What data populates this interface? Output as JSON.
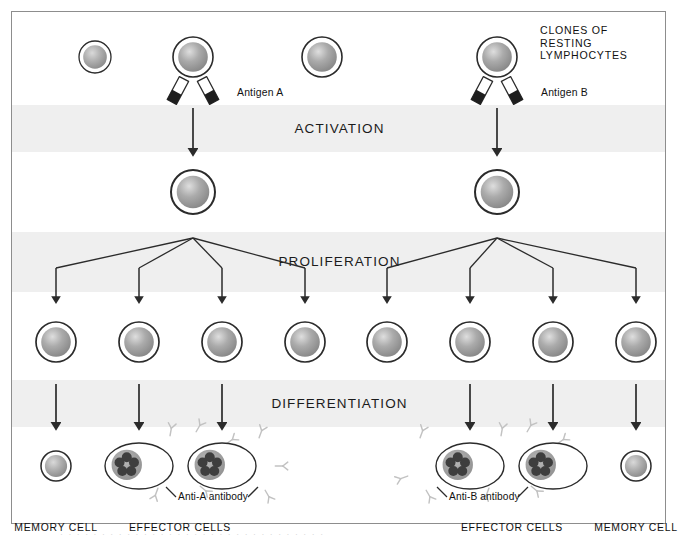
{
  "figure": {
    "frame_border_color": "#8d8d8d",
    "band_color": "#efefef",
    "cell_outline_color": "#2b2b2b",
    "receptor_color": "#bdbdbd",
    "arrow_color": "#2b2b2b"
  },
  "bands": [
    {
      "label": "ACTIVATION",
      "y": 105,
      "height": 47
    },
    {
      "label": "PROLIFERATION",
      "y": 232,
      "height": 60
    },
    {
      "label": "DIFFERENTIATION",
      "y": 380,
      "height": 47
    }
  ],
  "labels": {
    "clones_of_resting_lymphocytes": "CLONES OF\nRESTING\nLYMPHOCYTES",
    "clones_line1": "CLONES OF",
    "clones_line2": "RESTING",
    "clones_line3": "LYMPHOCYTES",
    "antigen_a": "Antigen A",
    "antigen_b": "Antigen B",
    "anti_a_antibody": "Anti-A antibody",
    "anti_b_antibody": "Anti-B antibody",
    "memory_cell_left": "MEMORY CELL",
    "memory_cell_right": "MEMORY CELL",
    "effector_cells_left": "EFFECTOR CELLS",
    "effector_cells_right": "EFFECTOR CELLS"
  },
  "resting_row": {
    "y": 57,
    "cells": [
      {
        "x": 95,
        "r": 16,
        "receptors": 8,
        "variant": "small"
      },
      {
        "x": 193,
        "r": 20,
        "receptors": 8,
        "variant": "selected-a"
      },
      {
        "x": 322,
        "r": 20,
        "receptors": 10,
        "variant": "normal"
      },
      {
        "x": 497,
        "r": 20,
        "receptors": 9,
        "variant": "selected-b"
      }
    ]
  },
  "antigens": {
    "a": {
      "cell_x": 193,
      "label_x": 237,
      "label_y": 94
    },
    "b": {
      "cell_x": 497,
      "label_x": 541,
      "label_y": 94
    }
  },
  "activated_row": {
    "y": 192,
    "cells": [
      {
        "x": 193,
        "r": 22
      },
      {
        "x": 497,
        "r": 22
      }
    ]
  },
  "clone_row": {
    "y": 342,
    "radius": 20,
    "cells_x": [
      56,
      139,
      222,
      305,
      387,
      470,
      553,
      636
    ]
  },
  "effector_row": {
    "y": 466,
    "memory_cells": [
      {
        "x": 56,
        "r": 15
      },
      {
        "x": 636,
        "r": 15
      }
    ],
    "effector_cells": [
      {
        "x": 139,
        "rx": 34,
        "ry": 23,
        "granules": 5
      },
      {
        "x": 222,
        "rx": 34,
        "ry": 23,
        "granules": 5
      },
      {
        "x": 470,
        "rx": 34,
        "ry": 23,
        "granules": 5
      },
      {
        "x": 553,
        "rx": 34,
        "ry": 23,
        "granules": 5
      }
    ]
  },
  "bottom_labels": [
    {
      "text": "MEMORY CELL",
      "x": 56,
      "y": 522
    },
    {
      "text": "EFFECTOR CELLS",
      "x": 180,
      "y": 522
    },
    {
      "text": "EFFECTOR CELLS",
      "x": 512,
      "y": 522
    },
    {
      "text": "MEMORY CELL",
      "x": 636,
      "y": 522
    }
  ],
  "activation_arrows": [
    {
      "x": 193,
      "y1": 108,
      "y2": 150
    },
    {
      "x": 497,
      "y1": 108,
      "y2": 150
    }
  ],
  "proliferation_trees": [
    {
      "root_x": 193,
      "root_y": 238,
      "targets": [
        56,
        139,
        222,
        305
      ],
      "split_y": 268,
      "tip_y": 298
    },
    {
      "root_x": 497,
      "root_y": 238,
      "targets": [
        387,
        470,
        553,
        636
      ],
      "split_y": 268,
      "tip_y": 298
    }
  ],
  "differentiation_arrows": [
    {
      "x": 56,
      "y1": 384,
      "y2": 424
    },
    {
      "x": 139,
      "y1": 384,
      "y2": 424
    },
    {
      "x": 222,
      "y1": 384,
      "y2": 424
    },
    {
      "x": 470,
      "y1": 384,
      "y2": 424
    },
    {
      "x": 553,
      "y1": 384,
      "y2": 424
    },
    {
      "x": 636,
      "y1": 384,
      "y2": 424
    }
  ],
  "scan_artifact": "· · · · · · · · · · · · · · · · · · · · · · · · · · · · · · · ·"
}
